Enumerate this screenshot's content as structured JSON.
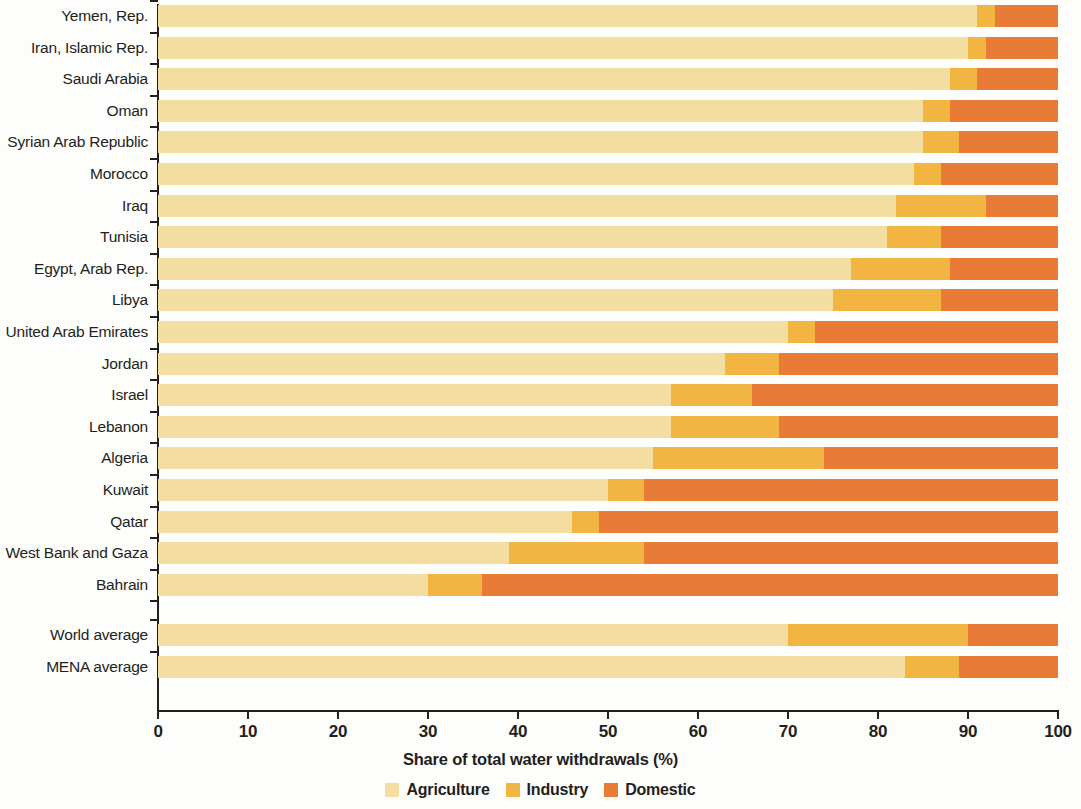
{
  "chart_data": {
    "type": "bar",
    "orientation": "horizontal",
    "stacked": true,
    "title": "",
    "xlabel": "Share  of total water withdrawals (%)",
    "ylabel": "",
    "xlim": [
      0,
      100
    ],
    "xticks": [
      0,
      10,
      20,
      30,
      40,
      50,
      60,
      70,
      80,
      90,
      100
    ],
    "grid": false,
    "legend_position": "bottom-center",
    "categories": [
      "Yemen, Rep.",
      "Iran, Islamic Rep.",
      "Saudi Arabia",
      "Oman",
      "Syrian Arab Republic",
      "Morocco",
      "Iraq",
      "Tunisia",
      "Egypt, Arab Rep.",
      "Libya",
      "United Arab Emirates",
      "Jordan",
      "Israel",
      "Lebanon",
      "Algeria",
      "Kuwait",
      "Qatar",
      "West Bank and Gaza",
      "Bahrain",
      "World average",
      "MENA average"
    ],
    "series": [
      {
        "name": "Agriculture",
        "color": "#f4dda0",
        "values": [
          91,
          90,
          88,
          85,
          85,
          84,
          82,
          81,
          77,
          75,
          70,
          63,
          57,
          57,
          55,
          50,
          46,
          39,
          30,
          70,
          83
        ]
      },
      {
        "name": "Industry",
        "color": "#f3b541",
        "values": [
          2,
          2,
          3,
          3,
          4,
          3,
          10,
          6,
          11,
          12,
          3,
          6,
          9,
          12,
          19,
          4,
          3,
          15,
          6,
          20,
          6
        ]
      },
      {
        "name": "Domestic",
        "color": "#e87b36",
        "values": [
          7,
          8,
          9,
          12,
          11,
          13,
          8,
          13,
          12,
          13,
          27,
          31,
          34,
          31,
          26,
          46,
          51,
          46,
          64,
          10,
          11
        ]
      }
    ],
    "group_break_after": "Bahrain"
  },
  "legend": {
    "items": [
      {
        "label": "Agriculture",
        "color": "#f4dda0"
      },
      {
        "label": "Industry",
        "color": "#f3b541"
      },
      {
        "label": "Domestic",
        "color": "#e87b36"
      }
    ]
  }
}
